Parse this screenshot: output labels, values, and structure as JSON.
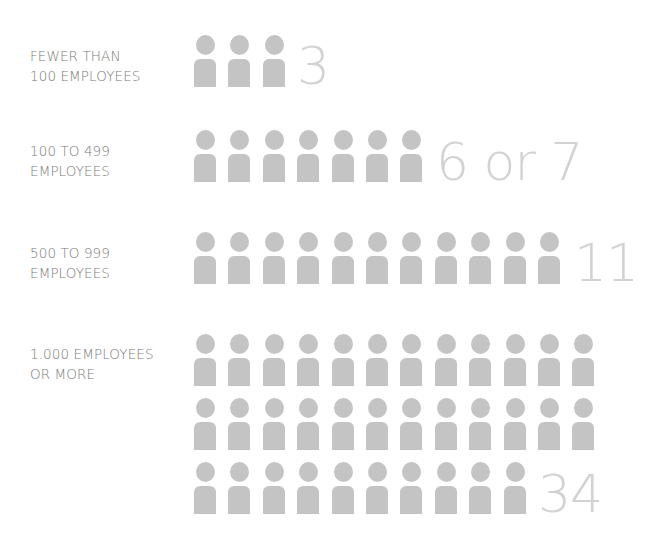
{
  "colors": {
    "icon": "#c4c4c4",
    "count": "#d2d2d2",
    "label": "#7a7a7a",
    "background": "#ffffff"
  },
  "groups": [
    {
      "label_line1": "FEWER THAN",
      "label_line2": "100 EMPLOYEES",
      "count_label": "3",
      "icons": 3
    },
    {
      "label_line1": "100 TO 499",
      "label_line2": "EMPLOYEES",
      "count_label": "6 or 7",
      "icons": 7
    },
    {
      "label_line1": "500 TO 999",
      "label_line2": "EMPLOYEES",
      "count_label": "11",
      "icons": 11
    },
    {
      "label_line1": "1.000 EMPLOYEES",
      "label_line2": "OR MORE",
      "count_label": "34",
      "icons": 34
    }
  ],
  "chart_data": {
    "type": "bar",
    "subtype": "pictogram",
    "title": "",
    "xlabel": "",
    "ylabel": "",
    "categories": [
      "Fewer than 100 employees",
      "100 to 499 employees",
      "500 to 999 employees",
      "1.000 employees or more"
    ],
    "values": [
      3,
      6.5,
      11,
      34
    ],
    "value_labels": [
      "3",
      "6 or 7",
      "11",
      "34"
    ],
    "icon_counts": [
      3,
      7,
      11,
      34
    ],
    "icon": "person-icon",
    "icons_per_row_max": 12,
    "grid": false,
    "legend": null
  }
}
